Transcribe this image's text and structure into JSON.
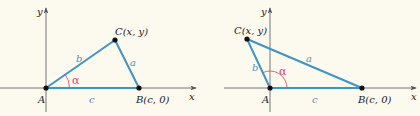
{
  "colors": {
    "background": "#fcf9ef",
    "axis": "#555555",
    "triangle": "#3f95c2",
    "angle": "#d8406a",
    "point": "#111111",
    "side_label": "#5b8db3"
  },
  "diagrams": [
    {
      "id": "acute",
      "axis_labels": {
        "x": "x",
        "y": "y"
      },
      "points": {
        "A": {
          "label": "A"
        },
        "B": {
          "label": "B(c, 0)"
        },
        "C": {
          "label": "C(x, y)"
        }
      },
      "sides": {
        "a": "a",
        "b": "b",
        "c": "c"
      },
      "angle": "α"
    },
    {
      "id": "obtuse",
      "axis_labels": {
        "x": "x",
        "y": "y"
      },
      "points": {
        "A": {
          "label": "A"
        },
        "B": {
          "label": "B(c, 0)"
        },
        "C": {
          "label": "C(x, y)"
        }
      },
      "sides": {
        "a": "a",
        "b": "b",
        "c": "c"
      },
      "angle": "α"
    }
  ]
}
